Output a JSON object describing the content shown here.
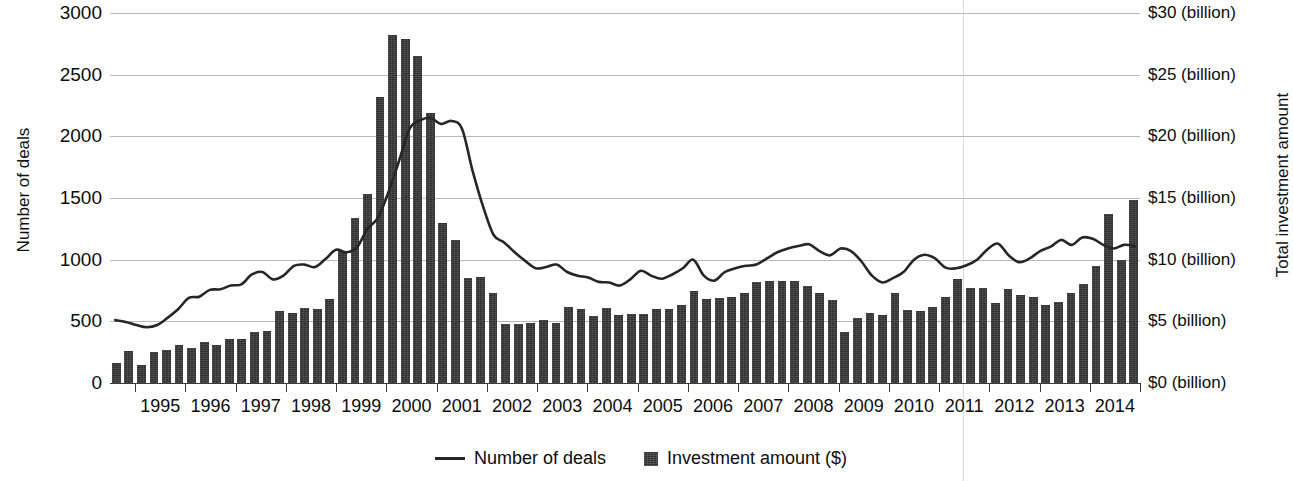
{
  "chart_data": {
    "type": "bar",
    "title": "",
    "subtitle": "",
    "xlabel": "",
    "ylabel": "Number of deals",
    "y2label": "Total investment amount",
    "ylim": [
      0,
      3000
    ],
    "y2lim": [
      0,
      30
    ],
    "grid": true,
    "legend_position": "bottom-center",
    "x_tick_labels": [
      "1995",
      "1996",
      "1997",
      "1998",
      "1999",
      "2000",
      "2001",
      "2002",
      "2003",
      "2004",
      "2005",
      "2006",
      "2007",
      "2008",
      "2009",
      "2010",
      "2011",
      "2012",
      "2013",
      "2014"
    ],
    "y_tick_labels": [
      "3000",
      "2500",
      "2000",
      "1500",
      "1000",
      "500",
      "0"
    ],
    "y_tick_values": [
      3000,
      2500,
      2000,
      1500,
      1000,
      500,
      0
    ],
    "y2_tick_labels": [
      "$30 (billion)",
      "$25 (billion)",
      "$20 (billion)",
      "$15 (billion)",
      "$10 (billion)",
      "$5 (billion)",
      "$0 (billion)"
    ],
    "y2_tick_values": [
      30,
      25,
      20,
      15,
      10,
      5,
      0
    ],
    "x_quarters": [
      "1994Q3",
      "1994Q4",
      "1995Q1",
      "1995Q2",
      "1995Q3",
      "1995Q4",
      "1996Q1",
      "1996Q2",
      "1996Q3",
      "1996Q4",
      "1997Q1",
      "1997Q2",
      "1997Q3",
      "1997Q4",
      "1998Q1",
      "1998Q2",
      "1998Q3",
      "1998Q4",
      "1999Q1",
      "1999Q2",
      "1999Q3",
      "1999Q4",
      "2000Q1",
      "2000Q2",
      "2000Q3",
      "2000Q4",
      "2001Q1",
      "2001Q2",
      "2001Q3",
      "2001Q4",
      "2002Q1",
      "2002Q2",
      "2002Q3",
      "2002Q4",
      "2003Q1",
      "2003Q2",
      "2003Q3",
      "2003Q4",
      "2004Q1",
      "2004Q2",
      "2004Q3",
      "2004Q4",
      "2005Q1",
      "2005Q2",
      "2005Q3",
      "2005Q4",
      "2006Q1",
      "2006Q2",
      "2006Q3",
      "2006Q4",
      "2007Q1",
      "2007Q2",
      "2007Q3",
      "2007Q4",
      "2008Q1",
      "2008Q2",
      "2008Q3",
      "2008Q4",
      "2009Q1",
      "2009Q2",
      "2009Q3",
      "2009Q4",
      "2010Q1",
      "2010Q2",
      "2010Q3",
      "2010Q4",
      "2011Q1",
      "2011Q2",
      "2011Q3",
      "2011Q4",
      "2012Q1",
      "2012Q2",
      "2012Q3",
      "2012Q4",
      "2013Q1",
      "2013Q2",
      "2013Q3",
      "2013Q4",
      "2014Q1"
    ],
    "series": [
      {
        "name": "Investment amount ($)",
        "axis": "right",
        "units": "billion USD",
        "render": "bar",
        "values": [
          1.6,
          2.6,
          1.5,
          2.5,
          2.7,
          3.1,
          2.8,
          3.3,
          3.1,
          3.6,
          3.6,
          4.1,
          4.2,
          5.8,
          5.7,
          6.1,
          6.0,
          6.8,
          10.7,
          13.4,
          15.3,
          23.2,
          28.2,
          27.9,
          26.5,
          21.9,
          13.0,
          11.6,
          8.5,
          8.6,
          7.3,
          4.8,
          4.8,
          4.9,
          5.1,
          4.9,
          6.2,
          6.0,
          5.4,
          6.1,
          5.5,
          5.6,
          5.6,
          6.0,
          6.0,
          6.3,
          7.5,
          6.8,
          6.9,
          7.0,
          7.3,
          8.2,
          8.3,
          8.3,
          8.3,
          7.9,
          7.3,
          6.7,
          4.1,
          5.3,
          5.7,
          5.5,
          7.3,
          5.9,
          5.8,
          6.2,
          7.0,
          8.4,
          7.7,
          7.7,
          6.5,
          7.6,
          7.1,
          7.0,
          6.3,
          6.6,
          7.3,
          8.0,
          9.5,
          13.7,
          10.0,
          14.8
        ]
      },
      {
        "name": "Number of deals",
        "axis": "left",
        "units": "deals",
        "render": "line",
        "values": [
          510,
          495,
          470,
          452,
          470,
          530,
          600,
          690,
          700,
          755,
          760,
          790,
          800,
          880,
          900,
          840,
          870,
          950,
          960,
          940,
          1005,
          1080,
          1060,
          1100,
          1250,
          1340,
          1550,
          1800,
          2060,
          2130,
          2150,
          2100,
          2125,
          2060,
          1720,
          1430,
          1200,
          1140,
          1060,
          990,
          930,
          940,
          960,
          900,
          870,
          855,
          820,
          815,
          790,
          840,
          910,
          870,
          845,
          880,
          930,
          1000,
          870,
          830,
          900,
          930,
          950,
          960,
          1010,
          1060,
          1090,
          1110,
          1125,
          1070,
          1035,
          1090,
          1070,
          985,
          870,
          815,
          850,
          900,
          1000,
          1040,
          1010,
          935,
          930,
          955,
          1000,
          1085,
          1130,
          1035,
          980,
          1010,
          1070,
          1105,
          1160,
          1120,
          1180,
          1170,
          1120,
          1090,
          1120,
          1110
        ]
      }
    ]
  },
  "axes": {
    "left_title": "Number of deals",
    "right_title": "Total investment amount"
  },
  "legend": {
    "items": [
      {
        "label": "Number of deals",
        "marker": "line-swatch"
      },
      {
        "label": "Investment amount ($)",
        "marker": "bar-swatch"
      }
    ]
  },
  "colors": {
    "bar": "#2f2f2f",
    "line": "#262626",
    "gridline": "#b9b9b9",
    "axis": "#3a3a3a",
    "text": "#0d0d0d",
    "background": "#ffffff"
  }
}
